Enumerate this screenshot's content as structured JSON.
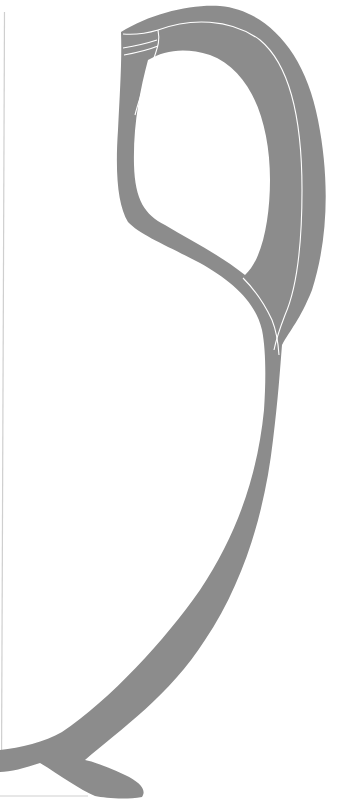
{
  "figure": {
    "type": "archaeological vessel profile drawing",
    "fill_color": "#8c8c8c",
    "outline_color": "#ffffff",
    "axis_line_color": "#c8c8c8",
    "background": "#ffffff"
  }
}
